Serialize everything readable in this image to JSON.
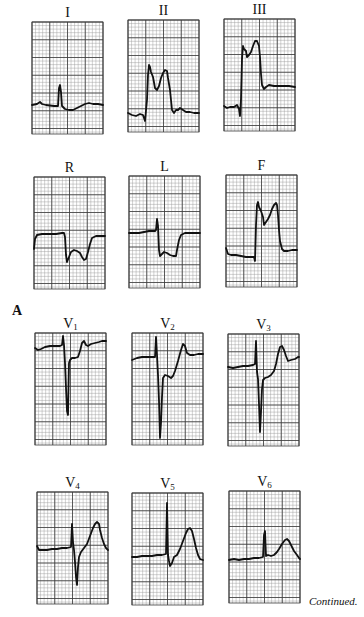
{
  "figure": {
    "panel_letter": "A",
    "continuation_note": "Continued.",
    "grid": {
      "width": 71,
      "height": 112,
      "minor": 3.55,
      "major": 17.75,
      "minor_color": "#9a9a9a",
      "major_color": "#3a3a3a",
      "trace_color": "#111111"
    },
    "leads": [
      {
        "id": "I",
        "label": "I",
        "sub": "",
        "x": 32,
        "y": 22,
        "trace": "0,83 5,82 8,80 10,82 14,83 22,84 26,84 27,66 28,63 29,70 30,84 33,87 37,88 41,88 45,86 49,84 53,82 57,81 61,82 66,82 71,83"
      },
      {
        "id": "II",
        "label": "II",
        "sub": "",
        "x": 128,
        "y": 20,
        "trace": "0,93 4,95 8,96 12,94 15,95 17,101 19,80 20,55 21,45 22,47 23,52 25,57 27,68 29,70 31,66 33,58 35,53 37,50 39,51 40,58 42,70 44,90 46,93 48,90 50,90 52,88 55,90 58,92 62,92 66,93 71,93"
      },
      {
        "id": "III",
        "label": "III",
        "sub": "",
        "x": 224,
        "y": 19,
        "trace": "0,87 3,89 6,88 10,88 13,86 15,90 16,97 17,80 18,40 19,27 20,30 22,32 23,38 25,36 27,33 29,27 31,22 33,22 35,27 36,38 37,55 38,66 40,70 42,68 45,66 50,67 55,67 60,67 65,67 71,68"
      },
      {
        "id": "R",
        "label": "R",
        "sub": "",
        "x": 34,
        "y": 177,
        "trace": "0,72 1,62 3,58 8,57 15,57 22,57 28,56 30,56 31,60 32,78 33,85 35,80 37,75 40,73 43,74 46,76 48,80 50,83 52,82 54,75 56,67 58,61 62,59 66,59 71,59"
      },
      {
        "id": "L",
        "label": "L",
        "sub": "",
        "x": 129,
        "y": 176,
        "trace": "0,57 5,57 10,57 15,56 20,55 26,55 27,54 28,43 29,50 30,74 31,80 33,78 35,76 38,77 41,79 44,80 47,80 48,74 50,64 52,59 56,57 62,57 71,57"
      },
      {
        "id": "F",
        "label": "F",
        "sub": "",
        "x": 226,
        "y": 175,
        "trace": "0,73 2,79 5,80 10,80 15,81 20,82 25,82 28,82 29,86 30,50 31,30 32,27 33,32 35,36 37,42 38,50 40,47 42,44 44,40 46,34 48,30 50,28 51,30 52,40 53,55 54,66 56,74 58,76 62,76 66,75 71,75"
      },
      {
        "id": "V1",
        "label": "V",
        "sub": "1",
        "x": 35,
        "y": 333,
        "trace": "0,15 3,17 6,16 10,14 15,13 20,13 25,13 27,12 28,3 29,12 30,30 31,55 32,78 33,82 33.5,55 34,30 35,27 37,25 40,25 43,24 45,18 47,10 49,8 51,12 53,13 56,11 60,10 64,9 67,8 71,8"
      },
      {
        "id": "V2",
        "label": "V",
        "sub": "2",
        "x": 132,
        "y": 333,
        "trace": "0,27 5,25 10,24 15,24 20,24 23,24 24,4 25,22 26,42 27,68 28,105 29,90 30,64 31,45 33,42 36,43 39,45 41,43 43,38 46,28 49,17 51,11 53,13 55,20 58,22 62,22 66,21 71,21"
      },
      {
        "id": "V3",
        "label": "V",
        "sub": "3",
        "x": 228,
        "y": 334,
        "trace": "0,33 5,34 10,33 15,32 20,32 25,31 27,30 28,7 29,38 30,45 31,70 32,98 33,78 34,55 35,46 37,44 40,43 43,41 46,37 48,30 50,20 52,13 54,12 56,16 58,22 60,27 63,26 67,25 70,23 71,23"
      },
      {
        "id": "V4",
        "label": "V",
        "sub": "4",
        "x": 37,
        "y": 492,
        "trace": "0,54 2,58 5,58 10,58 15,57 20,57 25,56 30,56 34,55 35,32 36,50 37,58 38,70 39,85 40,93 41,75 42,65 44,60 47,56 50,52 53,44 56,36 58,32 60,30 62,32 63,38 65,46 67,52 69,56 71,58"
      },
      {
        "id": "V5",
        "label": "V",
        "sub": "5",
        "x": 132,
        "y": 493,
        "trace": "0,64 5,64 10,63 15,63 20,63 25,62 30,62 34,61 35,10 36,62 37,68 38,73 40,70 42,64 45,62 48,56 51,48 54,40 56,36 58,35 60,38 62,46 64,55 66,62 68,66 71,67"
      },
      {
        "id": "V6",
        "label": "V",
        "sub": "6",
        "x": 229,
        "y": 491,
        "trace": "0,69 5,68 10,69 15,68 20,68 25,67 30,67 34,66 35,44 36,40 37,65 39,64 42,65 45,64 48,61 50,58 53,53 56,49 58,48 60,50 62,54 65,60 68,64 70,67 71,68"
      }
    ]
  }
}
